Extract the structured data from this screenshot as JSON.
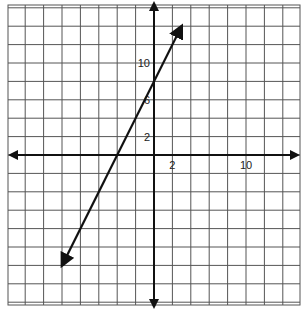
{
  "chart_data": {
    "type": "line",
    "title": "",
    "xlabel": "",
    "ylabel": "",
    "grid": true,
    "grid_step": 2,
    "xlim": [
      -16,
      16
    ],
    "ylim": [
      -16,
      16
    ],
    "x_tick_labels": [
      {
        "value": 2,
        "label": "2"
      },
      {
        "value": 10,
        "label": "10"
      }
    ],
    "y_tick_labels": [
      {
        "value": 2,
        "label": "2"
      },
      {
        "value": 6,
        "label": "6"
      },
      {
        "value": 10,
        "label": "10"
      }
    ],
    "series": [
      {
        "name": "line",
        "equation": "y = 2x + 8",
        "slope": 2,
        "intercept": 8,
        "x": [
          -10,
          3
        ],
        "y": [
          -12,
          14
        ],
        "arrows": "both"
      }
    ],
    "axes_arrows": true
  },
  "colors": {
    "grid": "#555555",
    "axis": "#111111",
    "line": "#111111",
    "background": "#ffffff"
  }
}
